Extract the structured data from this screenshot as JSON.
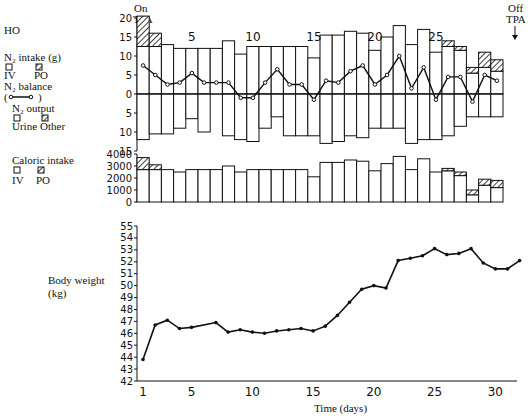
{
  "patient_label": "HO",
  "annotations": {
    "on_line1": "On",
    "on_line2": "TPA",
    "off_line1": "Off",
    "off_line2": "TPA"
  },
  "legend": {
    "n2_intake": "N₂ intake (g)",
    "iv": "IV",
    "po": "PO",
    "n2_balance": "N₂ balance",
    "n2_output": "N₂ output",
    "urine": "Urine",
    "other": "Other",
    "caloric_intake": "Caloric intake",
    "cal_iv": "IV",
    "cal_po": "PO",
    "body_weight": "Body weight",
    "body_weight_unit": "(kg)"
  },
  "xlabel": "Time (days)",
  "chart_data": [
    {
      "type": "bar",
      "title": "N2 intake / output / balance",
      "days": [
        1,
        2,
        3,
        4,
        5,
        6,
        7,
        8,
        9,
        10,
        11,
        12,
        13,
        14,
        15,
        16,
        17,
        18,
        19,
        20,
        21,
        22,
        23,
        24,
        25,
        26,
        27,
        28,
        29,
        30
      ],
      "yticks": [
        20,
        15,
        10,
        5,
        0,
        5,
        10,
        15
      ],
      "ylim": [
        -15,
        20
      ],
      "top_day_ticks": [
        "5",
        "10",
        "15",
        "20",
        "25"
      ],
      "series": [
        {
          "name": "IV intake",
          "values": [
            12.5,
            12.5,
            13,
            12,
            12,
            12,
            12,
            14,
            10.5,
            12.5,
            12.5,
            12.5,
            12.5,
            12.5,
            9.5,
            15.5,
            15.5,
            16.5,
            16,
            11.5,
            15,
            18,
            13,
            17,
            11,
            12.5,
            11.5,
            5.5,
            7,
            6
          ]
        },
        {
          "name": "PO intake",
          "values": [
            8,
            3.5,
            0,
            0,
            0,
            0,
            0,
            0,
            0,
            0,
            0,
            0,
            0,
            0,
            0,
            0,
            0,
            0,
            0,
            0,
            0,
            0,
            0,
            0,
            0,
            1.5,
            1,
            1.5,
            4,
            3
          ]
        },
        {
          "name": "Urine output",
          "values": [
            12,
            10.5,
            10.5,
            9,
            6.5,
            10,
            0,
            11,
            12,
            12.5,
            9,
            6,
            11,
            11,
            11,
            13,
            12.5,
            11,
            11.5,
            9,
            9,
            9,
            13,
            12,
            12,
            11,
            8.5,
            6,
            6,
            6
          ]
        },
        {
          "name": "N2 balance",
          "values": [
            7.5,
            5,
            2.5,
            3,
            5.5,
            3,
            3,
            3,
            -1,
            -1,
            3,
            6.5,
            2.5,
            2.5,
            -1.5,
            3.5,
            3,
            6,
            7.5,
            2.5,
            5,
            10,
            1.5,
            7,
            -1.5,
            4.5,
            4.5,
            -2,
            5,
            3.5
          ]
        }
      ]
    },
    {
      "type": "bar",
      "title": "Caloric intake",
      "yticks": [
        4000,
        3000,
        2000,
        1000,
        0
      ],
      "ylim": [
        0,
        4000
      ],
      "series": [
        {
          "name": "IV",
          "values": [
            2700,
            2700,
            2700,
            2500,
            2700,
            2700,
            2700,
            3000,
            2500,
            2700,
            2700,
            2700,
            2700,
            2700,
            2100,
            3300,
            3300,
            3500,
            3400,
            2600,
            3200,
            3800,
            2700,
            3600,
            2500,
            2600,
            2200,
            600,
            1400,
            1200
          ]
        },
        {
          "name": "PO",
          "values": [
            1000,
            400,
            0,
            0,
            0,
            0,
            0,
            0,
            0,
            0,
            0,
            0,
            0,
            0,
            0,
            0,
            0,
            0,
            0,
            0,
            0,
            0,
            0,
            0,
            0,
            200,
            300,
            400,
            500,
            600
          ]
        }
      ]
    },
    {
      "type": "line",
      "title": "Body weight",
      "ylabel": "Body weight (kg)",
      "xlabel": "Time (days)",
      "ylim": [
        42,
        55
      ],
      "yticks": [
        42,
        43,
        44,
        45,
        46,
        47,
        48,
        49,
        50,
        51,
        52,
        53,
        54,
        55
      ],
      "xticks": [
        1,
        5,
        10,
        15,
        20,
        25,
        30
      ],
      "x": [
        1,
        2,
        3,
        4,
        5,
        7,
        8,
        9,
        10,
        11,
        12,
        13,
        14,
        15,
        16,
        17,
        18,
        19,
        20,
        21,
        22,
        23,
        24,
        25,
        26,
        27,
        28,
        29,
        30,
        31,
        32
      ],
      "values": [
        43.8,
        46.7,
        47.1,
        46.4,
        46.5,
        46.9,
        46.1,
        46.3,
        46.1,
        46.0,
        46.2,
        46.3,
        46.4,
        46.2,
        46.6,
        47.5,
        48.6,
        49.7,
        50.0,
        49.8,
        52.1,
        52.3,
        52.5,
        53.1,
        52.6,
        52.7,
        53.1,
        51.9,
        51.4,
        51.4,
        52.1
      ]
    }
  ]
}
